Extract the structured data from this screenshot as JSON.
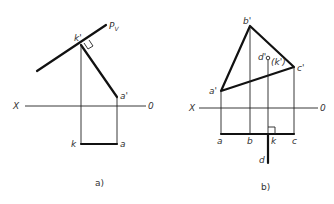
{
  "figure_a": {
    "caption": "a)",
    "labels": {
      "plane_trace": "P",
      "plane_trace_sub": "V",
      "k_prime": "k'",
      "a_prime": "a'",
      "axis_x": "X",
      "axis_o": "0",
      "k": "k",
      "a": "a"
    }
  },
  "figure_b": {
    "caption": "b)",
    "labels": {
      "b_prime": "b'",
      "c_prime": "c'",
      "a_prime": "a'",
      "d_prime": "d'",
      "k_prime_hidden": "(k')",
      "axis_x": "X",
      "axis_o": "0",
      "a": "a",
      "b": "b",
      "k": "k",
      "c": "c",
      "d": "d"
    }
  }
}
